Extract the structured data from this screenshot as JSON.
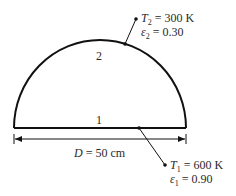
{
  "diagram": {
    "surface_top": {
      "label": "2",
      "T_symbol": "T",
      "T_sub": "2",
      "T_value": " = 300 K",
      "e_symbol": "ε",
      "e_sub": "2",
      "e_value": " = 0.30"
    },
    "surface_base": {
      "label": "1",
      "T_symbol": "T",
      "T_sub": "1",
      "T_value": " = 600 K",
      "e_symbol": "ε",
      "e_sub": "1",
      "e_value": " = 0.90"
    },
    "dimension": {
      "symbol": "D",
      "value": " = 50 cm"
    },
    "colors": {
      "line": "#111111",
      "text": "#2a2a2a"
    }
  }
}
